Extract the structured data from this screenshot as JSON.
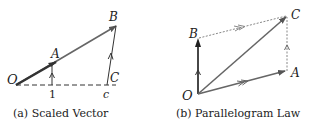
{
  "colors": {
    "vector": "#555555",
    "dark": "#222222",
    "dashed": "#333333",
    "dotted": "#888888"
  },
  "panel_a": {
    "caption": "(a) Scaled Vector",
    "labels": {
      "O": "O",
      "A": "A",
      "B": "B",
      "C": "C",
      "one": "1",
      "c": "c"
    }
  },
  "panel_b": {
    "caption": "(b) Parallelogram Law",
    "labels": {
      "O": "O",
      "A": "A",
      "B": "B",
      "C": "C"
    }
  }
}
